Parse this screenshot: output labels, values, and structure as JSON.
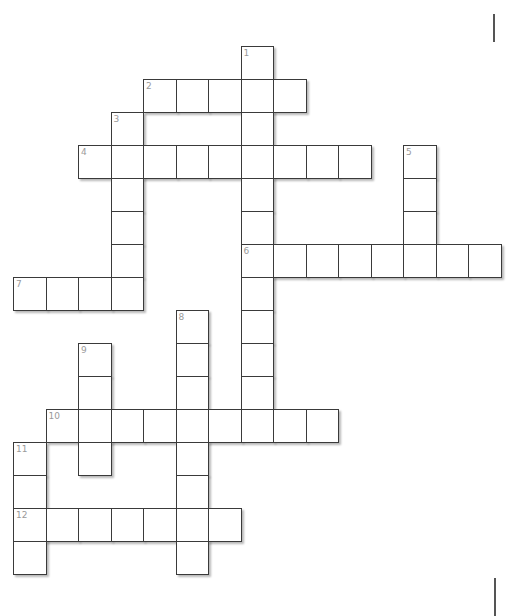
{
  "puzzle": {
    "type": "crossword",
    "grid": {
      "origin_x": 13,
      "origin_y": 46,
      "cell_w": 32.5,
      "cell_h": 33,
      "cols": 15,
      "rows": 16
    },
    "colors": {
      "border": "#3a3a3a",
      "number": "#9a9a9a",
      "cell_fill": "#ffffff",
      "background": "#ffffff"
    },
    "entries": [
      {
        "number": "1",
        "direction": "down",
        "col": 7,
        "row": 0,
        "length": 12
      },
      {
        "number": "2",
        "direction": "across",
        "col": 4,
        "row": 1,
        "length": 5
      },
      {
        "number": "3",
        "direction": "down",
        "col": 3,
        "row": 2,
        "length": 6
      },
      {
        "number": "4",
        "direction": "across",
        "col": 2,
        "row": 3,
        "length": 9
      },
      {
        "number": "5",
        "direction": "down",
        "col": 12,
        "row": 3,
        "length": 4
      },
      {
        "number": "6",
        "direction": "across",
        "col": 7,
        "row": 6,
        "length": 8
      },
      {
        "number": "7",
        "direction": "across",
        "col": 0,
        "row": 7,
        "length": 4
      },
      {
        "number": "8",
        "direction": "down",
        "col": 5,
        "row": 8,
        "length": 8
      },
      {
        "number": "9",
        "direction": "down",
        "col": 2,
        "row": 9,
        "length": 4
      },
      {
        "number": "10",
        "direction": "across",
        "col": 1,
        "row": 11,
        "length": 9
      },
      {
        "number": "11",
        "direction": "down",
        "col": 0,
        "row": 12,
        "length": 4
      },
      {
        "number": "12",
        "direction": "across",
        "col": 0,
        "row": 14,
        "length": 7
      }
    ]
  },
  "edge_marks": [
    {
      "x": 493,
      "y": 14,
      "height": 28
    },
    {
      "x": 494,
      "y": 578,
      "height": 38
    }
  ]
}
